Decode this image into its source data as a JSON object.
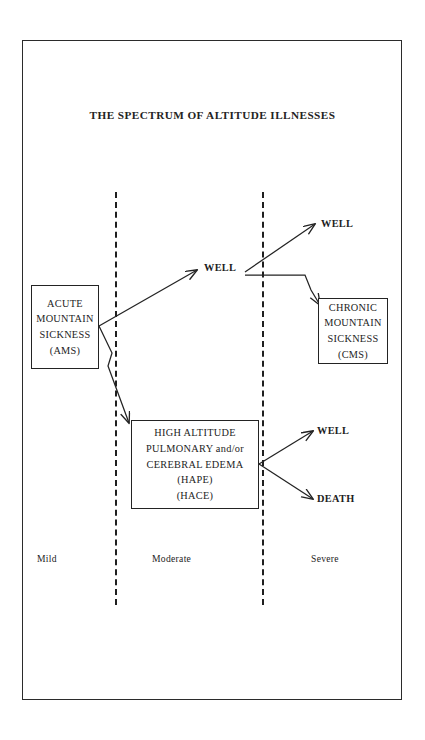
{
  "diagram": {
    "title": "THE SPECTRUM OF ALTITUDE ILLNESSES",
    "boxes": {
      "ams": {
        "name": "acute-mountain-sickness",
        "lines": [
          "ACUTE",
          "MOUNTAIN",
          "SICKNESS",
          "(AMS)"
        ]
      },
      "hape": {
        "name": "high-altitude-pulmonary-cerebral-edema",
        "lines": [
          "HIGH ALTITUDE",
          "PULMONARY and/or",
          "CEREBRAL EDEMA",
          "(HAPE)",
          "(HACE)"
        ]
      },
      "cms": {
        "name": "chronic-mountain-sickness",
        "lines": [
          "CHRONIC",
          "MOUNTAIN",
          "SICKNESS",
          "(CMS)"
        ]
      }
    },
    "outcomes": {
      "well_mid": "WELL",
      "well_upper": "WELL",
      "well_right": "WELL",
      "death": "DEATH"
    },
    "zones": {
      "mild": "Mild",
      "moderate": "Moderate",
      "severe": "Severe"
    },
    "colors": {
      "ink": "#232323",
      "background": "#ffffff",
      "divider": "#1f1f1f"
    }
  }
}
